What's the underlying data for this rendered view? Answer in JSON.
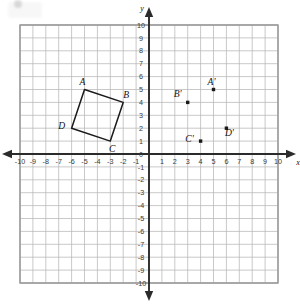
{
  "figure": {
    "title": "",
    "axis_labels": {
      "x": "x",
      "y": "y"
    }
  },
  "chart_data": {
    "type": "scatter",
    "title": "",
    "xlabel": "x",
    "ylabel": "y",
    "xlim": [
      -10,
      10
    ],
    "ylim": [
      -10,
      10
    ],
    "grid": true,
    "legend": "none",
    "x_ticks": [
      -10,
      -9,
      -8,
      -7,
      -6,
      -5,
      -4,
      -3,
      -2,
      -1,
      0,
      1,
      2,
      3,
      4,
      5,
      6,
      7,
      8,
      9,
      10
    ],
    "y_ticks": [
      -10,
      -9,
      -8,
      -7,
      -6,
      -5,
      -4,
      -3,
      -2,
      -1,
      0,
      1,
      2,
      3,
      4,
      5,
      6,
      7,
      8,
      9,
      10
    ],
    "x_tick_labels": [
      "-10",
      "-9",
      "-8",
      "-7",
      "-6",
      "-5",
      "-4",
      "-3",
      "-2",
      "-1",
      "0",
      "1",
      "2",
      "3",
      "4",
      "5",
      "6",
      "7",
      "8",
      "9",
      "10"
    ],
    "y_tick_labels": [
      "-10",
      "-9",
      "-8",
      "-7",
      "-6",
      "-5",
      "-4",
      "-3",
      "-2",
      "-1",
      "0",
      "1",
      "2",
      "3",
      "4",
      "5",
      "6",
      "7",
      "8",
      "9",
      "10"
    ],
    "series": [
      {
        "name": "Quadrilateral ABCD",
        "type": "polygon",
        "closed": true,
        "points": [
          {
            "label": "A",
            "x": -5,
            "y": 5,
            "label_dx": -2,
            "label_dy": -5
          },
          {
            "label": "B",
            "x": -2,
            "y": 4,
            "label_dx": 3,
            "label_dy": -4
          },
          {
            "label": "C",
            "x": -3,
            "y": 1,
            "label_dx": 2,
            "label_dy": 11
          },
          {
            "label": "D",
            "x": -6,
            "y": 2,
            "label_dx": -10,
            "label_dy": 1
          }
        ]
      },
      {
        "name": "Image points A' B' C' D'",
        "type": "points",
        "closed": false,
        "points": [
          {
            "label": "A'",
            "x": 5,
            "y": 5,
            "label_dx": -2,
            "label_dy": -5
          },
          {
            "label": "B'",
            "x": 3,
            "y": 4,
            "label_dx": -10,
            "label_dy": -5
          },
          {
            "label": "C'",
            "x": 4,
            "y": 1,
            "label_dx": -11,
            "label_dy": 1
          },
          {
            "label": "D'",
            "x": 6,
            "y": 2,
            "label_dx": 3,
            "label_dy": 8
          }
        ]
      }
    ]
  },
  "colors": {
    "grid_minor": "#b7b7b7",
    "grid_major": "#9a9a9a",
    "axis": "#2b2b2b",
    "shape_stroke": "#1a1a1a",
    "point_fill": "#1a1a1a",
    "label_text": "#111111",
    "tick_text": "#3a3a3a",
    "background": "#ffffff"
  }
}
